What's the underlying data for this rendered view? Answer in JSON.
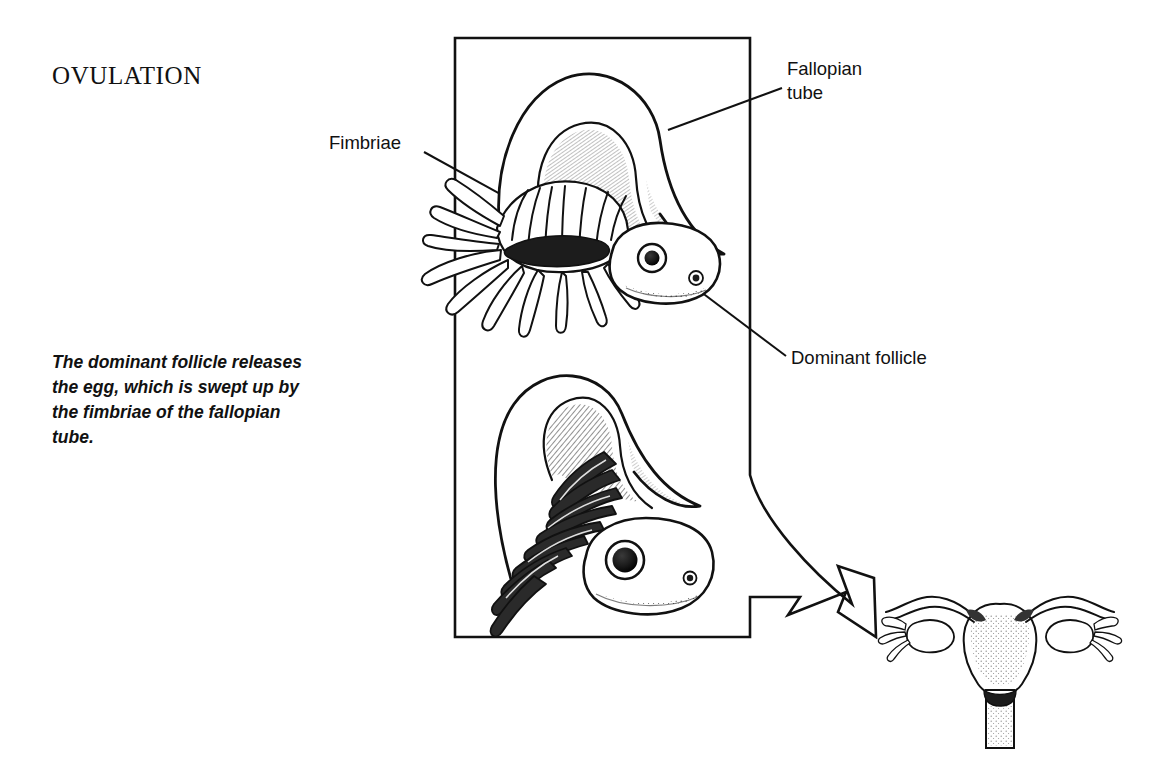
{
  "figure": {
    "title": "OVULATION",
    "caption": "The dominant follicle releases the egg, which is swept up by the fimbriae of the fallopian tube.",
    "ink_color": "#111111",
    "background_color": "#ffffff"
  },
  "labels": {
    "fimbriae": "Fimbriae",
    "fallopian_tube": "Fallopian\ntube",
    "dominant_follicle": "Dominant follicle"
  },
  "panel": {
    "description": "Rectangular frame enclosing two illustration stages; its right and bottom edges continue into a large outlined arrow pointing down-right toward the whole-uterus inset."
  },
  "illustrations": {
    "upper_stage": "Fallopian tube arching over with fringed fimbriae and infundibulum; ovary below bearing a raised dominant follicle",
    "lower_stage": "Fimbriae draped over the ovary, embracing the released egg at the dominant follicle",
    "inset": "Whole uterus with both fallopian tubes, ovaries, fimbriae and cervix"
  }
}
